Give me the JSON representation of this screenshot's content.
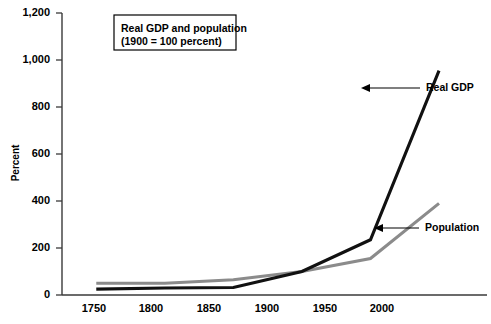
{
  "chart_data": {
    "type": "line",
    "title": "",
    "xlabel": "",
    "ylabel": "Percent",
    "x": [
      1750,
      1800,
      1850,
      1900,
      1950,
      2000
    ],
    "categories": [
      "1750",
      "1800",
      "1850",
      "1900",
      "1950",
      "2000"
    ],
    "series": [
      {
        "name": "Real GDP",
        "color": "#111111",
        "values": [
          25,
          30,
          32,
          100,
          235,
          955
        ]
      },
      {
        "name": "Population",
        "color": "#8b8b8b",
        "values": [
          50,
          50,
          65,
          100,
          155,
          390
        ]
      }
    ],
    "ylim": [
      0,
      1200
    ],
    "xlim": [
      1725,
      2035
    ],
    "ytick_values": [
      0,
      200,
      400,
      600,
      800,
      1000,
      1200
    ],
    "ytick_labels": [
      "0",
      "200",
      "400",
      "600",
      "800",
      "1,000",
      "1,200"
    ],
    "xtick_labels": [
      "1750",
      "1800",
      "1850",
      "1900",
      "1950",
      "2000"
    ],
    "grid": false,
    "legend_position": "inside-top-left-box",
    "annotations": [
      {
        "label": "Real GDP",
        "series": "Real GDP"
      },
      {
        "label": "Population",
        "series": "Population"
      }
    ]
  },
  "legend_box": {
    "line1": "Real GDP and population",
    "line2": "(1900 = 100 percent)"
  },
  "axis": {
    "y_title": "Percent",
    "y_ticks": [
      "1,200",
      "1,000",
      "800",
      "600",
      "400",
      "200",
      "0"
    ],
    "x_ticks": [
      "1750",
      "1800",
      "1850",
      "1900",
      "1950",
      "2000"
    ]
  },
  "annotations": {
    "gdp_label": "Real GDP",
    "population_label": "Population"
  },
  "colors": {
    "gdp_line": "#111111",
    "population_line": "#8b8b8b",
    "axis": "#3a3a3a",
    "text": "#000000",
    "background": "#ffffff"
  }
}
